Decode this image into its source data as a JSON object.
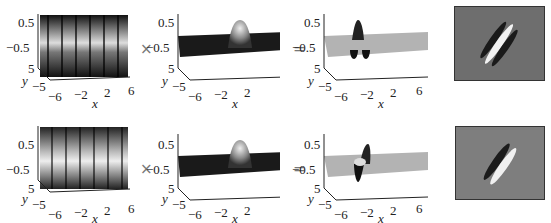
{
  "figure": {
    "operators": {
      "multiply": "×",
      "equals": "="
    },
    "axes": {
      "z_ticks": [
        "0.5",
        "−0.5"
      ],
      "y_ticks": [
        "5",
        "−5"
      ],
      "x_ticks": [
        "−6",
        "−2",
        "2",
        "6"
      ],
      "x_label": "x",
      "y_label": "y"
    },
    "rows": [
      {
        "name": "even-phase",
        "panels": [
          "sinusoid",
          "gaussian",
          "gabor-surface",
          "gabor-image"
        ]
      },
      {
        "name": "odd-phase",
        "panels": [
          "sinusoid",
          "gaussian",
          "gabor-surface",
          "gabor-image"
        ]
      }
    ]
  },
  "colors": {
    "background": "#ffffff",
    "image_gray": "#7a7a7a",
    "plane_gray": "#b0b0b0",
    "dark": "#111111"
  }
}
